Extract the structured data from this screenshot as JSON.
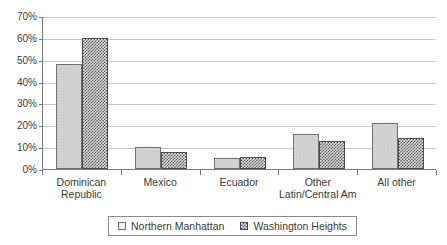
{
  "chart_data": {
    "type": "bar",
    "title": "",
    "xlabel": "",
    "ylabel": "",
    "ylim": [
      0,
      70
    ],
    "ytick_values": [
      0,
      10,
      20,
      30,
      40,
      50,
      60,
      70
    ],
    "ytick_labels": [
      "0%",
      "10%",
      "20%",
      "30%",
      "40%",
      "50%",
      "60%",
      "70%"
    ],
    "grid": true,
    "legend_position": "bottom",
    "categories": [
      "Dominican Republic",
      "Mexico",
      "Ecuador",
      "Other Latin/Central Am",
      "All other"
    ],
    "category_label_lines": [
      [
        "Dominican",
        "Republic"
      ],
      [
        "Mexico"
      ],
      [
        "Ecuador"
      ],
      [
        "Other",
        "Latin/Central Am"
      ],
      [
        "All other"
      ]
    ],
    "series": [
      {
        "name": "Northern Manhattan",
        "swatch": "light-checker",
        "color": "#d9d9d9",
        "values": [
          48,
          10,
          5,
          16,
          21
        ]
      },
      {
        "name": "Washington Heights",
        "swatch": "dark-checker",
        "color": "#4f4f4f",
        "values": [
          60,
          8,
          5.3,
          13,
          14
        ]
      }
    ]
  },
  "legend": {
    "items": [
      {
        "label": "Northern Manhattan"
      },
      {
        "label": "Washington Heights"
      }
    ]
  }
}
